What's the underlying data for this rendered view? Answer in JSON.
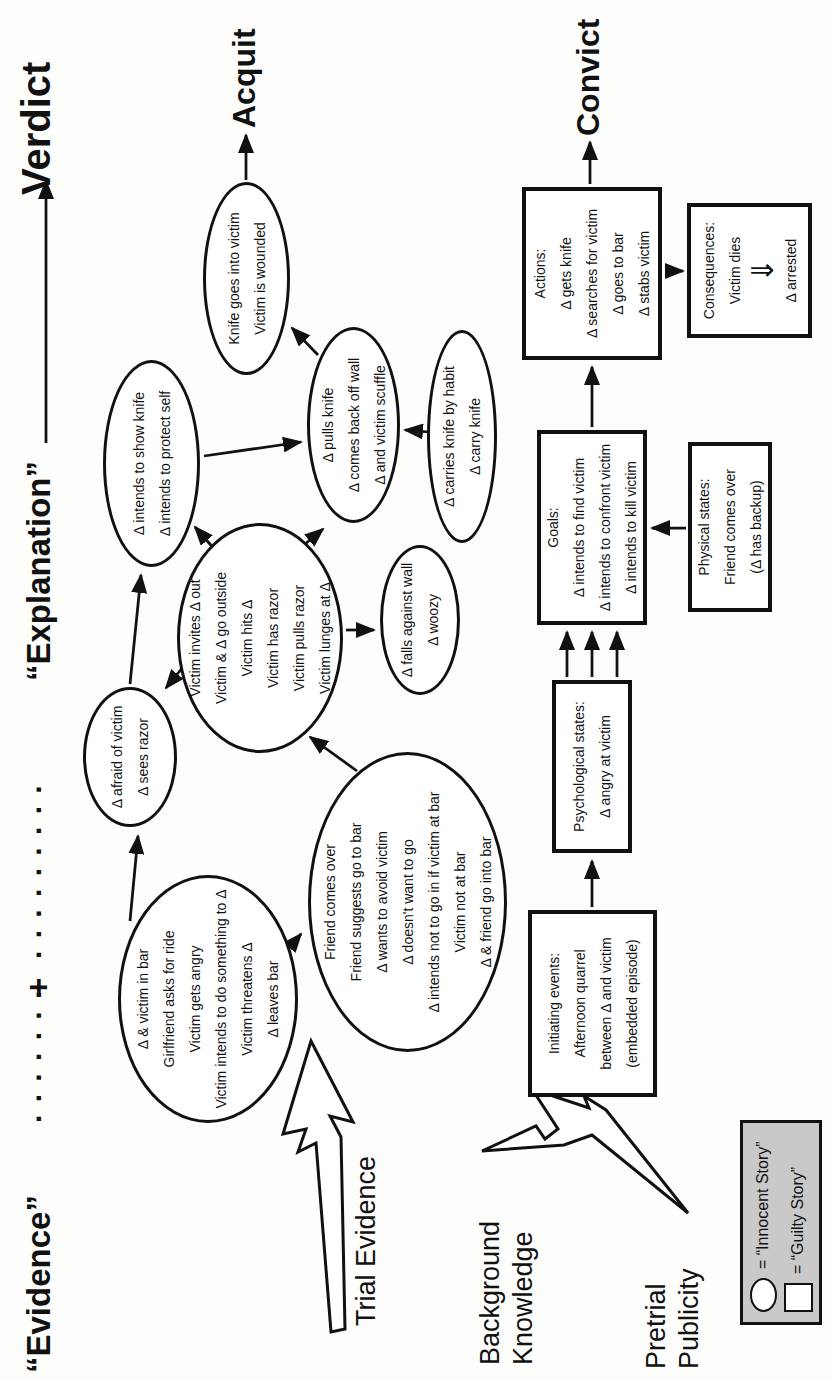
{
  "header": {
    "evidence_label": "“Evidence”",
    "dots_left": ". . . . . . .",
    "plus_sign": "+",
    "dots_right": ". . . . . . . . .",
    "explanation_label": "“Explanation”",
    "verdict_label": "Verdict"
  },
  "outcomes": {
    "acquit": "Acquit",
    "convict": "Convict"
  },
  "sources": {
    "trial_evidence": "Trial Evidence",
    "background_knowledge": [
      "Background",
      "Knowledge"
    ],
    "pretrial_publicity": [
      "Pretrial",
      "Publicity"
    ]
  },
  "innocent_story": {
    "bar_episode": {
      "lines": [
        "Δ & victim in bar",
        "Girlfriend asks for ride",
        "Victim gets angry",
        "Victim intends to do something to Δ",
        "Victim threatens Δ",
        "Δ leaves bar"
      ]
    },
    "afraid": {
      "lines": [
        "Δ afraid of victim",
        "Δ sees razor"
      ]
    },
    "show_knife": {
      "lines": [
        "Δ intends to show knife",
        "Δ intends to protect self"
      ]
    },
    "knife_wound": {
      "lines": [
        "Knife goes into victim",
        "Victim is wounded"
      ]
    },
    "victim_aggression": {
      "lines": [
        "Victim invites Δ out",
        "Victim & Δ go outside",
        "Victim hits Δ",
        "Victim has razor",
        "Victim pulls razor",
        "Victim lunges at Δ"
      ]
    },
    "pulls_knife": {
      "lines": [
        "Δ pulls knife",
        "Δ comes back off wall",
        "Δ and victim scuffle"
      ]
    },
    "carries_knife": {
      "lines": [
        "Δ carries knife by habit",
        "Δ carry knife"
      ]
    },
    "falls_wall": {
      "lines": [
        "Δ falls against wall",
        "Δ woozy"
      ]
    },
    "friend_episode": {
      "lines": [
        "Friend comes over",
        "Friend suggests go to bar",
        "Δ wants to avoid victim",
        "Δ doesn't want to go",
        "Δ intends not to go in if victim at bar",
        "Victim not at bar",
        "Δ & friend go into bar"
      ]
    }
  },
  "guilty_story": {
    "initiating_events": {
      "lines": [
        "Initiating events:",
        "Afternoon quarrel",
        "between Δ and victim",
        "(embedded episode)"
      ]
    },
    "psychological_states": {
      "lines": [
        "Psychological states:",
        "Δ angry at victim"
      ]
    },
    "goals": {
      "lines": [
        "Goals:",
        "Δ intends to find victim",
        "Δ intends to confront victim",
        "Δ intends to kill victim"
      ]
    },
    "physical_states": {
      "lines": [
        "Physical states:",
        "Friend comes over",
        "(Δ has backup)"
      ]
    },
    "actions": {
      "lines": [
        "Actions:",
        "Δ gets knife",
        "Δ searches for victim",
        "Δ goes to bar",
        "Δ stabs victim"
      ]
    },
    "consequences": {
      "lines": [
        "Consequences:",
        "Victim dies"
      ],
      "arrow_glyph": "⇓",
      "line_after": "Δ arrested"
    }
  },
  "legend": {
    "innocent_label": "= “Innocent Story”",
    "guilty_label": "= “Guilty Story”"
  }
}
